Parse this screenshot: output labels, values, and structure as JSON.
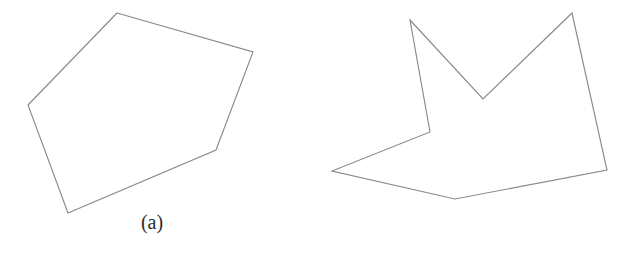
{
  "figure": {
    "background_color": "#ffffff",
    "stroke_color": "#8a8a8a",
    "caption_color": "#2b2b2b",
    "title": "",
    "panels": [
      {
        "id": "a",
        "caption": "(a)",
        "shape_name": "convex-polygon",
        "vertex_count": 5,
        "points": "117,13 253,52 216,150 68,213 28,105"
      },
      {
        "id": "b",
        "caption": "(b)",
        "shape_name": "concave-polygon",
        "vertex_count": 7,
        "points": "410,20 483,99 572,13 607,170 455,199 332,171 430,132"
      }
    ]
  }
}
